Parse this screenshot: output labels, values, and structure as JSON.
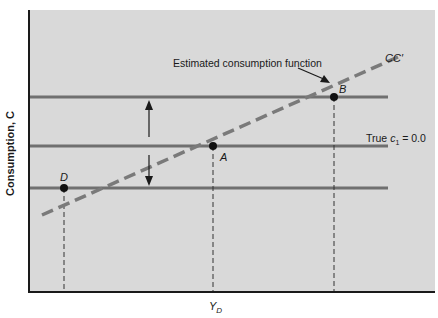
{
  "figure": {
    "background_color": "#d9d9d9",
    "line_color": "#6e6e6e",
    "axis_color": "#1a1a1a",
    "y_axis_label": "Consumption, C",
    "x_axis_tick_label_main": "Y",
    "x_axis_tick_label_sub": "D",
    "estimated_function_label": "Estimated consumption function",
    "cc_label": "CC′",
    "true_line_label_prefix": "True ",
    "true_line_label_var": "c",
    "true_line_label_sub": "1",
    "true_line_label_suffix": " = 0.0",
    "points": [
      {
        "name": "A",
        "x": 213,
        "y": 146
      },
      {
        "name": "B",
        "x": 334,
        "y": 97
      },
      {
        "name": "D",
        "x": 64,
        "y": 188
      }
    ]
  }
}
